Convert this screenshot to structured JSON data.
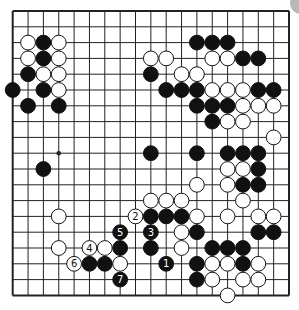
{
  "diagram": {
    "type": "go-board",
    "size": 19,
    "geometry": {
      "x0": 12.7,
      "y0": 11,
      "dx": 15.35,
      "dy": 15.8
    },
    "colors": {
      "line": "#222222",
      "black_stone": "#111111",
      "white_stone": "#ffffff",
      "stone_outline": "#111111",
      "corner_artifact": "#b8b8b8"
    },
    "star_points": [
      [
        3,
        9
      ]
    ],
    "black_stones": [
      [
        2,
        2
      ],
      [
        2,
        3
      ],
      [
        1,
        4
      ],
      [
        0,
        5
      ],
      [
        2,
        5
      ],
      [
        1,
        6
      ],
      [
        3,
        6
      ],
      [
        9,
        4
      ],
      [
        12,
        2
      ],
      [
        13,
        2
      ],
      [
        14,
        2
      ],
      [
        15,
        3
      ],
      [
        16,
        3
      ],
      [
        10,
        5
      ],
      [
        11,
        5
      ],
      [
        12,
        5
      ],
      [
        16,
        5
      ],
      [
        17,
        5
      ],
      [
        12,
        6
      ],
      [
        13,
        6
      ],
      [
        14,
        6
      ],
      [
        13,
        7
      ],
      [
        9,
        9
      ],
      [
        12,
        9
      ],
      [
        14,
        9
      ],
      [
        15,
        9
      ],
      [
        16,
        9
      ],
      [
        16,
        10
      ],
      [
        15,
        11
      ],
      [
        16,
        11
      ],
      [
        2,
        10
      ],
      [
        9,
        13
      ],
      [
        10,
        13
      ],
      [
        11,
        13
      ],
      [
        12,
        14
      ],
      [
        16,
        14
      ],
      [
        17,
        14
      ],
      [
        13,
        15
      ],
      [
        14,
        15
      ],
      [
        15,
        15
      ],
      [
        9,
        15
      ],
      [
        7,
        15
      ],
      [
        5,
        16
      ],
      [
        6,
        16
      ],
      [
        12,
        16
      ],
      [
        15,
        16
      ],
      [
        12,
        17
      ]
    ],
    "white_stones": [
      [
        1,
        2
      ],
      [
        3,
        2
      ],
      [
        1,
        3
      ],
      [
        3,
        3
      ],
      [
        2,
        4
      ],
      [
        3,
        4
      ],
      [
        3,
        5
      ],
      [
        9,
        3
      ],
      [
        10,
        3
      ],
      [
        13,
        3
      ],
      [
        14,
        3
      ],
      [
        11,
        4
      ],
      [
        12,
        4
      ],
      [
        13,
        5
      ],
      [
        14,
        5
      ],
      [
        15,
        5
      ],
      [
        15,
        6
      ],
      [
        16,
        6
      ],
      [
        17,
        6
      ],
      [
        14,
        7
      ],
      [
        15,
        7
      ],
      [
        17,
        8
      ],
      [
        14,
        10
      ],
      [
        15,
        10
      ],
      [
        12,
        11
      ],
      [
        14,
        11
      ],
      [
        9,
        12
      ],
      [
        10,
        12
      ],
      [
        11,
        12
      ],
      [
        15,
        12
      ],
      [
        12,
        13
      ],
      [
        14,
        13
      ],
      [
        16,
        13
      ],
      [
        17,
        13
      ],
      [
        3,
        13
      ],
      [
        11,
        14
      ],
      [
        3,
        15
      ],
      [
        6,
        15
      ],
      [
        11,
        15
      ],
      [
        7,
        16
      ],
      [
        13,
        16
      ],
      [
        14,
        16
      ],
      [
        16,
        16
      ],
      [
        13,
        17
      ],
      [
        15,
        17
      ],
      [
        16,
        17
      ],
      [
        14,
        18
      ]
    ],
    "numbered_moves": [
      {
        "n": "1",
        "color": "black",
        "pos": [
          10,
          16
        ]
      },
      {
        "n": "2",
        "color": "white",
        "pos": [
          8,
          13
        ]
      },
      {
        "n": "3",
        "color": "black",
        "pos": [
          9,
          14
        ]
      },
      {
        "n": "4",
        "color": "white",
        "pos": [
          5,
          15
        ]
      },
      {
        "n": "5",
        "color": "black",
        "pos": [
          7,
          14
        ]
      },
      {
        "n": "6",
        "color": "white",
        "pos": [
          4,
          16
        ]
      },
      {
        "n": "7",
        "color": "black",
        "pos": [
          7,
          17
        ]
      }
    ]
  }
}
